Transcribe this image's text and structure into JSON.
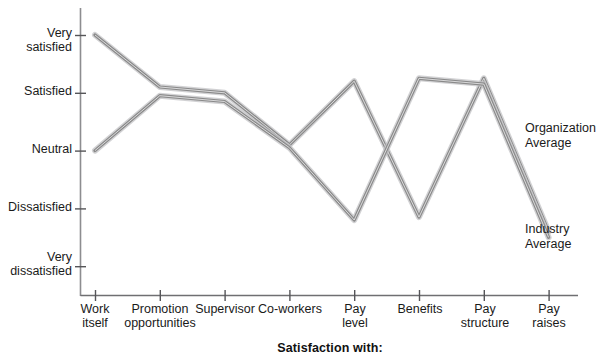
{
  "chart_data": {
    "type": "line",
    "title": "",
    "xlabel": "Satisfaction with:",
    "ylabel": "",
    "grid": false,
    "legend_position": "right-inline",
    "categories": [
      "Work\nitself",
      "Promotion\nopportunities",
      "Supervisor",
      "Co-workers",
      "Pay\nlevel",
      "Benefits",
      "Pay\nstructure",
      "Pay\nraises"
    ],
    "ytick_labels": [
      "Very\nsatisfied",
      "Satisfied",
      "Neutral",
      "Dissatisfied",
      "Very\ndissatisfied"
    ],
    "ytick_values": [
      5,
      4,
      3,
      2,
      1
    ],
    "ylim": [
      0.7,
      5.25
    ],
    "series": [
      {
        "name": "Organization\nAverage",
        "short_name": "Organization Average",
        "color": "#8a8a8a",
        "values": [
          5.0,
          4.1,
          4.0,
          3.1,
          4.2,
          1.85,
          4.25,
          1.6
        ]
      },
      {
        "name": "Industry\nAverage",
        "short_name": "Industry Average",
        "color": "#8a8a8a",
        "values": [
          3.0,
          3.95,
          3.85,
          3.05,
          1.8,
          4.25,
          4.15,
          1.5
        ]
      }
    ]
  },
  "labels": {
    "axis_title": "Satisfaction with:",
    "series_org": "Organization\nAverage",
    "series_industry": "Industry\nAverage"
  }
}
